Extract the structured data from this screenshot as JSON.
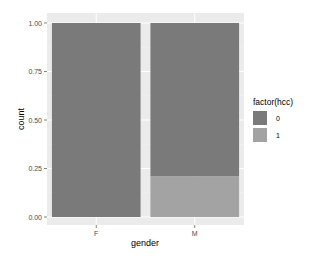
{
  "chart_data": {
    "type": "bar",
    "stacked": true,
    "position": "fill",
    "title": "",
    "xlabel": "gender",
    "ylabel": "count",
    "categories": [
      "F",
      "M"
    ],
    "series": [
      {
        "name": "0",
        "values": [
          1.0,
          0.79
        ],
        "color": "#7a7a7a"
      },
      {
        "name": "1",
        "values": [
          0.0,
          0.21
        ],
        "color": "#a3a3a3"
      }
    ],
    "ylim": [
      0,
      1
    ],
    "yticks": [
      "0.00",
      "0.25",
      "0.50",
      "0.75",
      "1.00"
    ],
    "grid": true,
    "legend": {
      "title": "factor(hcc)",
      "position": "right",
      "entries": [
        "0",
        "1"
      ]
    },
    "panel_background": "#ebebeb"
  }
}
